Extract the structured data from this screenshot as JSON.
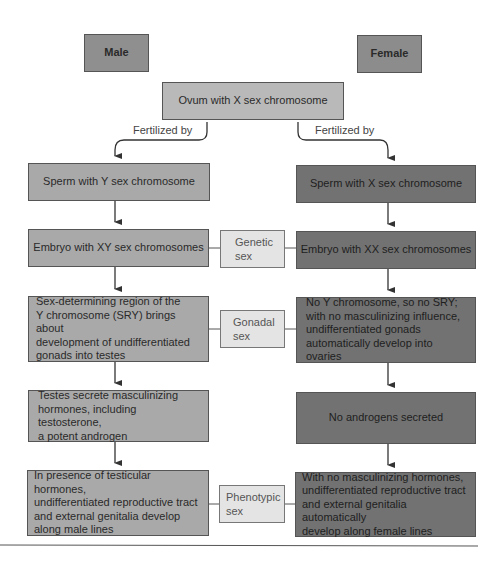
{
  "headers": {
    "male": "Male",
    "female": "Female"
  },
  "ovum": "Ovum with X sex chromosome",
  "fertilized_left": "Fertilized by",
  "fertilized_right": "Fertilized by",
  "male_column": {
    "sperm": "Sperm with Y sex chromosome",
    "embryo": "Embryo with XY sex chromosomes",
    "gonad": "Sex-determining region of the\nY chromosome (SRY) brings about\ndevelopment of undifferentiated\ngonads into testes",
    "hormones": "Testes secrete masculinizing\nhormones, including testosterone,\na potent androgen",
    "phenotype": "In presence of testicular hormones,\nundifferentiated reproductive tract\nand external genitalia develop\nalong male lines"
  },
  "female_column": {
    "sperm": "Sperm with X sex chromosome",
    "embryo": "Embryo with XX sex chromosomes",
    "gonad": "No Y chromosome, so no SRY;\nwith no masculinizing influence,\nundifferentiated gonads\nautomatically develop into ovaries",
    "hormones": "No androgens secreted",
    "phenotype": "With no masculinizing hormones,\nundifferentiated reproductive tract\nand external genitalia automatically\ndevelop along female lines"
  },
  "sex_labels": {
    "genetic": "Genetic\nsex",
    "gonadal": "Gonadal\nsex",
    "phenotypic": "Phenotypic\nsex"
  },
  "colors": {
    "male": "#a9a9a9",
    "female": "#727272",
    "ovum": "#b9b9b9",
    "label": "#e4e4e4"
  }
}
